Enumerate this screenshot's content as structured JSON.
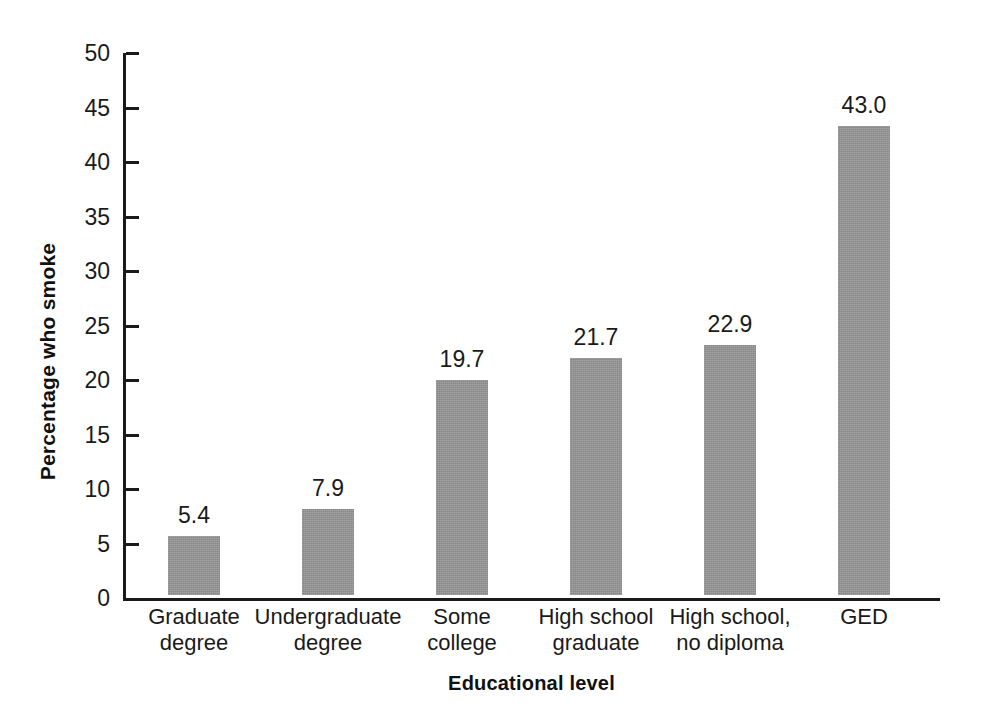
{
  "chart_data": {
    "type": "bar",
    "title": "",
    "xlabel": "Educational level",
    "ylabel": "Percentage who smoke",
    "categories": [
      "Graduate degree",
      "Undergraduate degree",
      "Some college",
      "High school graduate",
      "High school, no diploma",
      "GED"
    ],
    "category_lines": [
      [
        "Graduate",
        "degree"
      ],
      [
        "Undergraduate",
        "degree"
      ],
      [
        "Some",
        "college"
      ],
      [
        "High school",
        "graduate"
      ],
      [
        "High school,",
        "no diploma"
      ],
      [
        "GED"
      ]
    ],
    "values": [
      5.4,
      7.9,
      19.7,
      21.7,
      22.9,
      43.0
    ],
    "value_labels": [
      "5.4",
      "7.9",
      "19.7",
      "21.7",
      "22.9",
      "43.0"
    ],
    "ylim": [
      0,
      50
    ],
    "ytick_values": [
      0,
      5,
      10,
      15,
      20,
      25,
      30,
      35,
      40,
      45,
      50
    ],
    "ytick_labels": [
      "0",
      "5",
      "10",
      "15",
      "20",
      "25",
      "30",
      "35",
      "40",
      "45",
      "50"
    ],
    "grid": false,
    "legend": null,
    "bar_color": "#969696",
    "axis_color": "#1a1a1a",
    "background_color": "#ffffff"
  }
}
